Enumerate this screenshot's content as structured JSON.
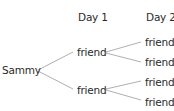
{
  "diagram": {
    "type": "tree",
    "headers": {
      "day1": "Day 1",
      "day2": "Day 2"
    },
    "root": {
      "label": "Sammy"
    },
    "level1": [
      {
        "label": "friend",
        "children": [
          {
            "label": "friend"
          },
          {
            "label": "friend"
          }
        ]
      },
      {
        "label": "friend",
        "children": [
          {
            "label": "friend"
          },
          {
            "label": "friend"
          }
        ]
      }
    ]
  }
}
